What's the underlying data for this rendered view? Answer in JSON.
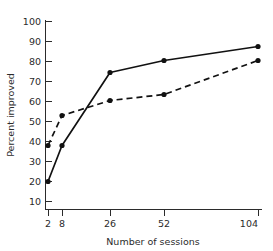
{
  "chart_data": {
    "type": "line",
    "title": "",
    "xlabel": "Number of sessions",
    "ylabel": "Percent improved",
    "x": [
      2,
      8,
      26,
      52,
      104
    ],
    "xtick_labels": [
      "2",
      "8",
      "26",
      "52",
      "104"
    ],
    "ytick_labels": [
      "10",
      "20",
      "30",
      "40",
      "50",
      "60",
      "70",
      "80",
      "90",
      "100"
    ],
    "yticks": [
      10,
      20,
      30,
      40,
      50,
      60,
      70,
      80,
      90,
      100
    ],
    "ylim": [
      0,
      100
    ],
    "grid": false,
    "legend": "none",
    "series": [
      {
        "name": "solid-series",
        "style": "solid",
        "marker": "filled-circle",
        "color": "#111111",
        "values": [
          20,
          38,
          74.5,
          80.5,
          87.5
        ]
      },
      {
        "name": "dashed-series",
        "style": "dashed",
        "marker": "filled-circle",
        "color": "#111111",
        "values": [
          38,
          53,
          60.5,
          63.5,
          80.5
        ]
      }
    ]
  },
  "figure": {
    "background_color": "#ffffff",
    "axis_color": "#2b2b2b"
  }
}
